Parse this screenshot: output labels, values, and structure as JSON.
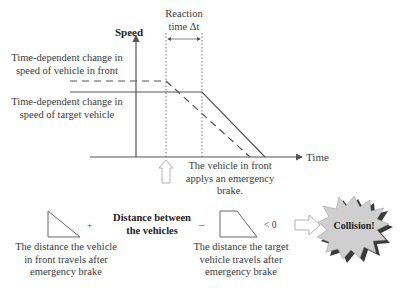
{
  "chart": {
    "y_axis_label": "Speed",
    "x_axis_label": "Time",
    "reaction_label_line1": "Reaction",
    "reaction_label_line2": "time Δt",
    "front_vehicle_label_line1": "Time-dependent change in",
    "front_vehicle_label_line2": "speed of vehicle in front",
    "target_vehicle_label_line1": "Time-dependent change in",
    "target_vehicle_label_line2": "speed of target vehicle",
    "brake_note_line1": "The vehicle in front",
    "brake_note_line2": "applys an emergency",
    "brake_note_line3": "brake."
  },
  "equation": {
    "plus": "+",
    "minus": "–",
    "distance_between_line1": "Distance between",
    "distance_between_line2": "the vehicles",
    "less_than": "< 0",
    "front_distance_line1": "The distance the vehicle",
    "front_distance_line2": "in front travels after",
    "front_distance_line3": "emergency brake",
    "target_distance_line1": "The distance the target",
    "target_distance_line2": "vehicle travels after",
    "target_distance_line3": "emergency brake",
    "result": "Collision!"
  },
  "colors": {
    "line": "#555555",
    "burst_fill": "#cfcfcf",
    "burst_shadow": "#3a3a3a"
  }
}
